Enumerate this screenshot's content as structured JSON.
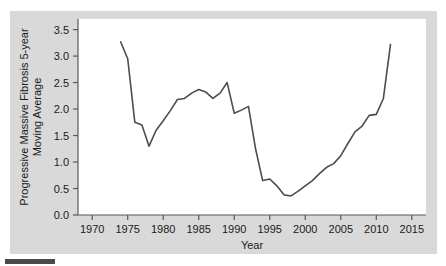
{
  "figure": {
    "background_color": "#d9d9d9",
    "plot_background_color": "#ffffff",
    "line_color": "#4d4d4d",
    "axis_color": "#595959",
    "text_color": "#1a1a1a"
  },
  "chart_data": {
    "type": "line",
    "title": "",
    "xlabel": "Year",
    "ylabel": "Progressive Massive Fibrosis 5-year Moving Average",
    "ylabel_line1": "Progressive Massive Fibrosis 5-year",
    "ylabel_line2": "Moving Average",
    "xlim": [
      1968,
      2017
    ],
    "ylim": [
      0.0,
      3.7
    ],
    "xticks": [
      1970,
      1975,
      1980,
      1985,
      1990,
      1995,
      2000,
      2005,
      2010,
      2015
    ],
    "xtick_labels": [
      "1970",
      "1975",
      "1980",
      "1985",
      "1990",
      "1995",
      "2000",
      "2005",
      "2010",
      "2015"
    ],
    "yticks": [
      0.0,
      0.5,
      1.0,
      1.5,
      2.0,
      2.5,
      3.0,
      3.5
    ],
    "ytick_labels": [
      "0.0",
      "0.5",
      "1.0",
      "1.5",
      "2.0",
      "2.5",
      "3.0",
      "3.5"
    ],
    "grid": false,
    "legend": false,
    "x": [
      1974,
      1975,
      1976,
      1977,
      1978,
      1979,
      1980,
      1981,
      1982,
      1983,
      1984,
      1985,
      1986,
      1987,
      1988,
      1989,
      1990,
      1991,
      1992,
      1993,
      1994,
      1995,
      1996,
      1997,
      1998,
      1999,
      2000,
      2001,
      2002,
      2003,
      2004,
      2005,
      2006,
      2007,
      2008,
      2009,
      2010,
      2011,
      2012
    ],
    "values": [
      3.27,
      2.95,
      1.75,
      1.7,
      1.3,
      1.6,
      1.78,
      1.97,
      2.18,
      2.2,
      2.3,
      2.37,
      2.32,
      2.2,
      2.3,
      2.5,
      1.92,
      1.98,
      2.05,
      1.25,
      0.65,
      0.68,
      0.55,
      0.38,
      0.36,
      0.45,
      0.55,
      0.65,
      0.78,
      0.9,
      0.97,
      1.12,
      1.35,
      1.57,
      1.68,
      1.88,
      1.9,
      2.2,
      3.22
    ],
    "series": [
      {
        "name": "Progressive Massive Fibrosis 5-year Moving Average",
        "values": [
          3.27,
          2.95,
          1.75,
          1.7,
          1.3,
          1.6,
          1.78,
          1.97,
          2.18,
          2.2,
          2.3,
          2.37,
          2.32,
          2.2,
          2.3,
          2.5,
          1.92,
          1.98,
          2.05,
          1.25,
          0.65,
          0.68,
          0.55,
          0.38,
          0.36,
          0.45,
          0.55,
          0.65,
          0.78,
          0.9,
          0.97,
          1.12,
          1.35,
          1.57,
          1.68,
          1.88,
          1.9,
          2.2,
          3.22
        ]
      }
    ]
  }
}
